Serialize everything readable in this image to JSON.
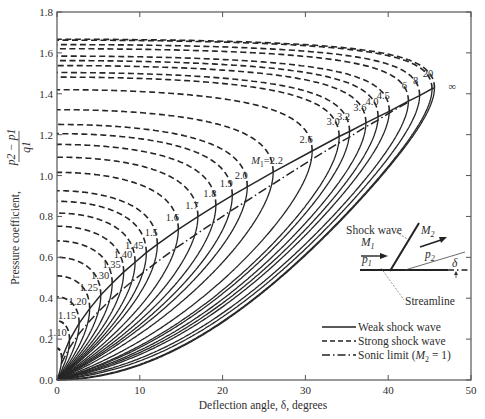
{
  "chart_data": {
    "type": "line",
    "title": "",
    "xlabel": "Deflection angle, δ, degrees",
    "ylabel": "Pressure coefficient, (p2 − p1)/q1",
    "ylabel_prefix": "Pressure coefficient,",
    "ylabel_num": "p2 − p1",
    "ylabel_den": "q1",
    "xlim": [
      0,
      50
    ],
    "ylim": [
      0.0,
      1.8
    ],
    "x_ticks": [
      0,
      10,
      20,
      30,
      40,
      50
    ],
    "x_tick_labels": [
      "0",
      "10",
      "20",
      "30",
      "40",
      "50"
    ],
    "y_ticks": [
      0.0,
      0.2,
      0.4,
      0.6,
      0.8,
      1.0,
      1.2,
      1.4,
      1.6,
      1.8
    ],
    "y_tick_labels": [
      "0.0",
      "0.2",
      "0.4",
      "0.6",
      "0.8",
      "1.0",
      "1.2",
      "1.4",
      "1.6",
      "1.8"
    ],
    "grid": false,
    "gamma": 1.4,
    "mach_numbers": [
      1.05,
      1.1,
      1.15,
      1.2,
      1.25,
      1.3,
      1.35,
      1.4,
      1.45,
      1.5,
      1.6,
      1.7,
      1.8,
      1.9,
      2.0,
      2.2,
      2.6,
      3.0,
      3.2,
      3.6,
      4.0,
      4.5,
      6,
      8,
      20,
      1000
    ],
    "curve_labels": [
      {
        "text": "1.10",
        "mach": 1.1
      },
      {
        "text": "1.15",
        "mach": 1.15
      },
      {
        "text": "1.20",
        "mach": 1.2
      },
      {
        "text": "1.25",
        "mach": 1.25
      },
      {
        "text": "1.30",
        "mach": 1.3
      },
      {
        "text": "1.35",
        "mach": 1.35
      },
      {
        "text": "1.40",
        "mach": 1.4
      },
      {
        "text": "1.45",
        "mach": 1.45
      },
      {
        "text": "1.5",
        "mach": 1.5
      },
      {
        "text": "1.6",
        "mach": 1.6
      },
      {
        "text": "1.7",
        "mach": 1.7
      },
      {
        "text": "1.8",
        "mach": 1.8
      },
      {
        "text": "1.9",
        "mach": 1.9
      },
      {
        "text": "2.0",
        "mach": 2.0
      },
      {
        "text": "M1=2.2",
        "mach": 2.2
      },
      {
        "text": "2.6",
        "mach": 2.6
      },
      {
        "text": "3.0",
        "mach": 3.0
      },
      {
        "text": "3.2",
        "mach": 3.2
      },
      {
        "text": "3.6",
        "mach": 3.6
      },
      {
        "text": "4.0",
        "mach": 4.0
      },
      {
        "text": "4.5",
        "mach": 4.5
      },
      {
        "text": "6",
        "mach": 6
      },
      {
        "text": "8",
        "mach": 8
      },
      {
        "text": "20",
        "mach": 20
      },
      {
        "text": "∞",
        "mach": 1000
      }
    ],
    "series": [
      {
        "name": "Weak shock wave",
        "style": "solid"
      },
      {
        "name": "Strong shock wave",
        "style": "dashed"
      },
      {
        "name": "Sonic limit (M2 = 1)",
        "style": "dash-dot"
      }
    ],
    "sample_points": {
      "note": "approximate readings of max-deflection endpoints (δmax, Cp)",
      "points": [
        {
          "M1": 1.5,
          "delta_max": 12.1,
          "cp": 0.69
        },
        {
          "M1": 2.0,
          "delta_max": 23.0,
          "cp": 0.95
        },
        {
          "M1": 3.0,
          "delta_max": 34.1,
          "cp": 1.15
        },
        {
          "M1": 20,
          "delta_max": 45.3,
          "cp": 1.4
        },
        {
          "M1": "∞",
          "delta_max": 45.6,
          "cp": 1.4
        }
      ]
    },
    "legend_position": "lower right",
    "inset": {
      "shock_label": "Shock wave",
      "m1_label": "M",
      "m1_sub": "1",
      "m2_label": "M",
      "m2_sub": "2",
      "p1_label": "p",
      "p1_sub": "1",
      "p2_label": "p",
      "p2_sub": "2",
      "delta_label": "δ",
      "streamline_label": "Streamline"
    }
  },
  "legend": {
    "weak": "Weak shock wave",
    "strong": "Strong shock wave",
    "sonic_prefix": "Sonic limit (",
    "sonic_m": "M",
    "sonic_sub": "2",
    "sonic_suffix": " = 1)"
  },
  "colors": {
    "ink": "#262626",
    "axis": "#555555",
    "background": "#ffffff"
  }
}
